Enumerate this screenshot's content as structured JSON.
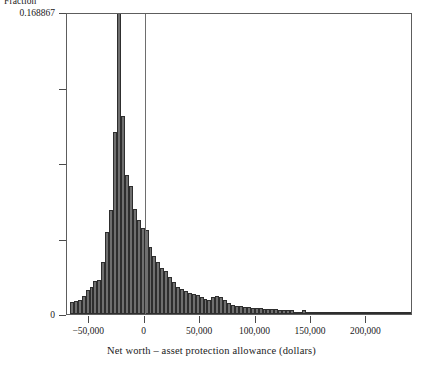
{
  "chart_data": {
    "type": "bar",
    "title": "",
    "xlabel": "Net worth – asset protection allowance (dollars)",
    "ylabel": "Fraction",
    "xlim": [
      -70000,
      242000
    ],
    "ylim": [
      0,
      0.168867
    ],
    "grid": false,
    "legend": "none",
    "annotations": [
      {
        "name": "zero-reference-line",
        "x": 0,
        "orientation": "vertical"
      }
    ],
    "xticks": [
      -50000,
      0,
      50000,
      100000,
      150000,
      200000
    ],
    "xticklabels": [
      "−50,000",
      "0",
      "50,000",
      "100,000",
      "150,000",
      "200,000"
    ],
    "yticks": [
      0,
      0.042217,
      0.084434,
      0.12665,
      0.168867
    ],
    "yticklabels": [
      "0",
      "",
      "",
      "",
      "0.168867"
    ],
    "bin_width": 3545,
    "bin_left_edges": [
      -67400,
      -63855,
      -60310,
      -56765,
      -53220,
      -49675,
      -46130,
      -42585,
      -39040,
      -35495,
      -31950,
      -28405,
      -24860,
      -21315,
      -17770,
      -14225,
      -10680,
      -7135,
      -3590,
      -45,
      3500,
      7045,
      10590,
      14135,
      17680,
      21225,
      24770,
      28315,
      31860,
      35405,
      38950,
      42495,
      46040,
      49585,
      53130,
      56675,
      60220,
      63765,
      67310,
      70855,
      74400,
      77945,
      81490,
      85035,
      88580,
      92125,
      95670,
      99215,
      102760,
      106305,
      109850,
      113395,
      116940,
      120485,
      124030,
      127575,
      131120,
      134665,
      138210,
      141755,
      145300,
      148845,
      152390,
      155935,
      159480,
      163025,
      166570,
      170115,
      173660,
      177205,
      180750,
      184295,
      187840,
      191385,
      194930,
      198475,
      202020,
      205565,
      209110,
      212655,
      216200,
      219745,
      223290,
      226835,
      230380,
      233925,
      237470
    ],
    "values": [
      0.0066,
      0.0073,
      0.0079,
      0.0099,
      0.0132,
      0.0152,
      0.0185,
      0.0191,
      0.0291,
      0.0457,
      0.0583,
      0.1019,
      0.1689,
      0.1106,
      0.0775,
      0.0715,
      0.0589,
      0.0523,
      0.0483,
      0.047,
      0.0377,
      0.0324,
      0.0291,
      0.0258,
      0.0238,
      0.0205,
      0.0179,
      0.0152,
      0.0139,
      0.0126,
      0.0119,
      0.0113,
      0.0106,
      0.0093,
      0.0086,
      0.0079,
      0.0093,
      0.0099,
      0.0093,
      0.0079,
      0.006,
      0.0053,
      0.0046,
      0.0046,
      0.004,
      0.004,
      0.0033,
      0.0033,
      0.0033,
      0.0026,
      0.0026,
      0.0026,
      0.0026,
      0.002,
      0.002,
      0.002,
      0.002,
      0.0013,
      0.0013,
      0.002,
      0.0013,
      0.0013,
      0.0013,
      0.0007,
      0.0013,
      0.0007,
      0.0007,
      0.0007,
      0.0007,
      0.0007,
      0.0007,
      0.0007,
      0.0007,
      0.0007,
      0.0003,
      0.0003,
      0.0007,
      0.0003,
      0.0007,
      0.0003,
      0.0003,
      0.0003,
      0.0003,
      0.0007,
      0.0003,
      0.0003,
      0.0007
    ],
    "colors": {
      "bar_fill": "#6f6f6f",
      "bar_edge": "#2e2e2e",
      "frame": "#5d5d5d",
      "axis_text": "#1a1a1a",
      "zero_rule": "#6e6e6e"
    }
  }
}
